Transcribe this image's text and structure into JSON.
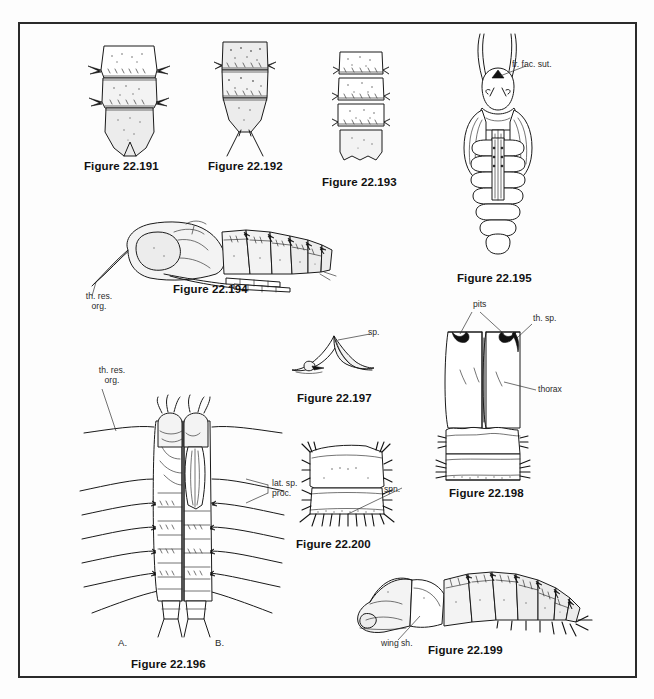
{
  "plate": {
    "kind": "scientific-illustration-plate",
    "subject": "Insect pupae and larvae morphology",
    "background_color": "#fdfdfd",
    "frame_color": "#2b2b2b",
    "ink_color": "#1a1a1a"
  },
  "figures": [
    {
      "id": "fig-22-191",
      "caption": "Figure 22.191",
      "description": "Abdominal segments of pupa, dorsal view, with lateral spine-like processes",
      "labels": []
    },
    {
      "id": "fig-22-192",
      "caption": "Figure 22.192",
      "description": "Terminal abdominal segments of pupa with paired caudal filaments",
      "labels": []
    },
    {
      "id": "fig-22-193",
      "caption": "Figure 22.193",
      "description": "Four abdominal segments of pupa with spinose margins",
      "labels": []
    },
    {
      "id": "fig-22-194",
      "caption": "Figure 22.194",
      "description": "Pupa, lateral view, with thoracic respiratory organ",
      "labels": [
        {
          "id": "label-th-res-org",
          "text": "th. res.\norg.",
          "line1": "th. res.",
          "line2": "org."
        }
      ]
    },
    {
      "id": "fig-22-195",
      "caption": "Figure 22.195",
      "description": "Pupa, ventral view, with long respiratory horns and frontofacial suture",
      "labels": [
        {
          "id": "label-fr-fac-sut",
          "text": "fr. fac. sut."
        }
      ]
    },
    {
      "id": "fig-22-196",
      "caption": "Figure 22.196",
      "description": "Larva, dorsal (A) and ventral (B) views, with lateral setal processes",
      "labels": [
        {
          "id": "label-th-res-org-2",
          "line1": "th. res.",
          "line2": "org."
        },
        {
          "id": "label-lat-sp-proc",
          "line1": "lat. sp.",
          "line2": "proc."
        },
        {
          "id": "label-view-a",
          "text": "A."
        },
        {
          "id": "label-view-b",
          "text": "B."
        }
      ]
    },
    {
      "id": "fig-22-197",
      "caption": "Figure 22.197",
      "description": "Detail of spiracle on pupal cuticle",
      "labels": [
        {
          "id": "label-sp",
          "text": "sp."
        }
      ]
    },
    {
      "id": "fig-22-198",
      "caption": "Figure 22.198",
      "description": "Thorax of pupa, dorsal view, showing pits and thoracic spiracles",
      "labels": [
        {
          "id": "label-pits",
          "text": "pits"
        },
        {
          "id": "label-th-sp",
          "text": "th. sp."
        },
        {
          "id": "label-thorax",
          "text": "thorax"
        }
      ]
    },
    {
      "id": "fig-22-199",
      "caption": "Figure 22.199",
      "description": "Pupa, lateral view, with wing sheath and spinose abdominal segments",
      "labels": [
        {
          "id": "label-wing-sh",
          "text": "wing sh."
        }
      ]
    },
    {
      "id": "fig-22-200",
      "caption": "Figure 22.200",
      "description": "Abdominal segment of pupa with spinose band",
      "labels": [
        {
          "id": "label-spn",
          "text": "spn."
        }
      ]
    }
  ]
}
